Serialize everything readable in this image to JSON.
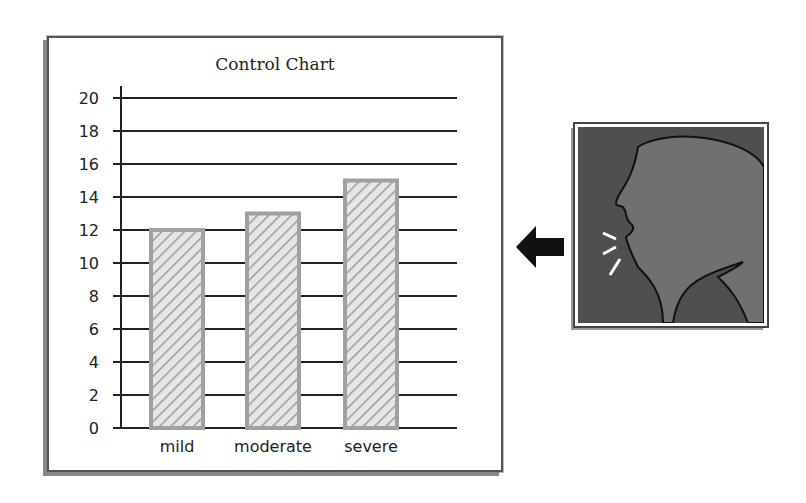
{
  "chart_data": {
    "type": "bar",
    "title": "Control Chart",
    "categories": [
      "mild",
      "moderate",
      "severe"
    ],
    "values": [
      12,
      13,
      15
    ],
    "xlabel": "",
    "ylabel": "",
    "ylim": [
      0,
      20
    ],
    "yticks": [
      0,
      2,
      4,
      6,
      8,
      10,
      12,
      14,
      16,
      18,
      20
    ],
    "grid": true,
    "bar_style": "hatched gray",
    "legend": null
  },
  "illustration": {
    "subject": "profile of person coughing",
    "arrow": "left-arrow pointing to chart"
  }
}
